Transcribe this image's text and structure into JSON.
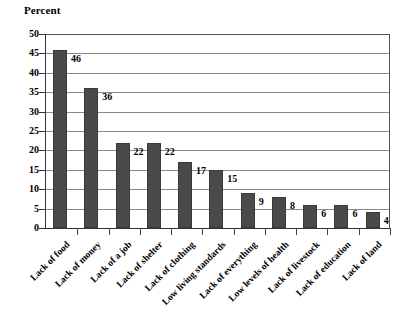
{
  "chart_data": {
    "type": "bar",
    "title": "",
    "ylabel": "Percent",
    "xlabel": "",
    "ylim": [
      0,
      50
    ],
    "yticks": [
      0,
      5,
      10,
      15,
      20,
      25,
      30,
      35,
      40,
      45,
      50
    ],
    "ytick_labels": [
      "0",
      "5",
      "10",
      "15",
      "20",
      "25",
      "30",
      "35",
      "40",
      "45",
      "50"
    ],
    "grid": true,
    "legend": "none",
    "bar_color": "#4a4a4a",
    "categories": [
      "Lack of food",
      "Lack of money",
      "Lack of a job",
      "Lack of shelter",
      "Lack of clothing",
      "Low living standards",
      "Lack of everything",
      "Low levels of health",
      "Lack of livestock",
      "Lack of education",
      "Lack of land"
    ],
    "values": [
      46,
      36,
      22,
      22,
      17,
      15,
      9,
      8,
      6,
      6,
      4
    ],
    "data_labels": [
      "46",
      "36",
      "22",
      "22",
      "17",
      "15",
      "9",
      "8",
      "6",
      "6",
      "4"
    ],
    "data_label_position": "right-of-bar-top"
  }
}
